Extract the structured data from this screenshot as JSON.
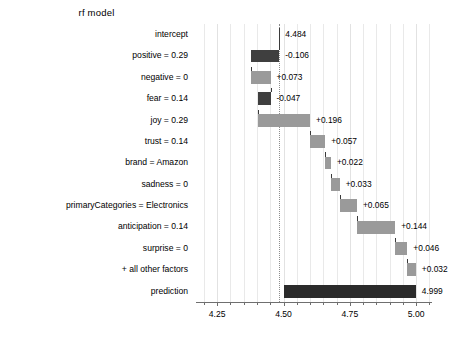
{
  "chart_data": {
    "type": "bar",
    "subtype": "waterfall-breakdown",
    "title": "rf model",
    "xlabel": "",
    "ylabel": "",
    "xlim": [
      4.17,
      5.06
    ],
    "grid": true,
    "legend": false,
    "reference_line": 4.484,
    "xticks": [
      4.25,
      4.5,
      4.75,
      5.0
    ],
    "xticklabels": [
      "4.25",
      "4.50",
      "4.75",
      "5.00"
    ],
    "minor_tick_step": 0.05,
    "categories": [
      "intercept",
      "positive = 0.29",
      "negative = 0",
      "fear = 0.14",
      "joy = 0.29",
      "trust = 0.14",
      "brand = Amazon",
      "sadness = 0",
      "primaryCategories = Electronics",
      "anticipation = 0.14",
      "surprise = 0",
      "+ all other factors",
      "prediction"
    ],
    "values": [
      4.484,
      -0.106,
      0.073,
      -0.047,
      0.196,
      0.057,
      0.022,
      0.033,
      0.065,
      0.144,
      0.046,
      0.032,
      4.999
    ],
    "value_labels": [
      "4.484",
      "-0.106",
      "+0.073",
      "-0.047",
      "+0.196",
      "+0.057",
      "+0.022",
      "+0.033",
      "+0.065",
      "+0.144",
      "+0.046",
      "+0.032",
      "4.999"
    ],
    "bar_spans": [
      {
        "start": 4.484,
        "end": 4.484,
        "kind": "intercept"
      },
      {
        "start": 4.378,
        "end": 4.484,
        "kind": "negative"
      },
      {
        "start": 4.378,
        "end": 4.451,
        "kind": "positive"
      },
      {
        "start": 4.404,
        "end": 4.451,
        "kind": "negative"
      },
      {
        "start": 4.404,
        "end": 4.6,
        "kind": "positive"
      },
      {
        "start": 4.6,
        "end": 4.657,
        "kind": "positive"
      },
      {
        "start": 4.657,
        "end": 4.679,
        "kind": "positive"
      },
      {
        "start": 4.679,
        "end": 4.712,
        "kind": "positive"
      },
      {
        "start": 4.712,
        "end": 4.777,
        "kind": "positive"
      },
      {
        "start": 4.777,
        "end": 4.921,
        "kind": "positive"
      },
      {
        "start": 4.921,
        "end": 4.967,
        "kind": "positive"
      },
      {
        "start": 4.967,
        "end": 4.999,
        "kind": "positive"
      },
      {
        "start": 4.5,
        "end": 4.999,
        "kind": "total"
      }
    ],
    "colors": {
      "negative_bar": "#3f3f3f",
      "positive_bar": "#9a9a9a",
      "total_bar": "#2b2b2b",
      "gridline": "#e9e9e9",
      "reference_line": "#8d8d8d",
      "axis": "#6f6f6f",
      "text": "#000000",
      "background": "#ffffff"
    }
  }
}
